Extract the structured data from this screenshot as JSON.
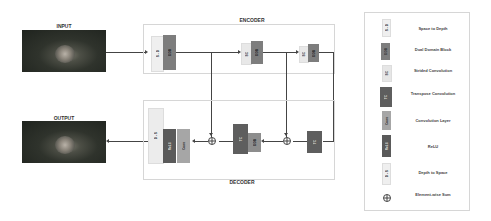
{
  "diagram": {
    "input_label": "INPUT",
    "output_label": "OUTPUT",
    "encoder_label": "ENCODER",
    "decoder_label": "DECODER",
    "encoder_blocks": [
      {
        "id": "s2d",
        "text": "S - D",
        "type": "space-to-depth"
      },
      {
        "id": "ddb1",
        "text": "DDB",
        "type": "dual-domain-block"
      },
      {
        "id": "sc1",
        "text": "SC",
        "type": "strided-convolution"
      },
      {
        "id": "ddb2",
        "text": "DDB",
        "type": "dual-domain-block"
      },
      {
        "id": "sc2",
        "text": "SC",
        "type": "strided-convolution"
      },
      {
        "id": "ddb3",
        "text": "DDB",
        "type": "dual-domain-block"
      }
    ],
    "decoder_blocks": [
      {
        "id": "tc1",
        "text": "TC",
        "type": "transpose-convolution"
      },
      {
        "id": "ddb4",
        "text": "DDB",
        "type": "dual-domain-block"
      },
      {
        "id": "tc2",
        "text": "TC",
        "type": "transpose-convolution"
      },
      {
        "id": "d2s",
        "text": "D - S",
        "type": "depth-to-space"
      },
      {
        "id": "relu",
        "text": "ReLU",
        "type": "relu"
      },
      {
        "id": "conv",
        "text": "Conv",
        "type": "convolution-layer"
      }
    ]
  },
  "legend": {
    "items": [
      {
        "label": "Space to Depth",
        "icon_text": "S - D",
        "icon": "space-to-depth-block-icon"
      },
      {
        "label": "Dual Domain Block",
        "icon_text": "DDB",
        "icon": "dual-domain-block-icon"
      },
      {
        "label": "Strided Convolution",
        "icon_text": "SC",
        "icon": "strided-convolution-block-icon"
      },
      {
        "label": "Transpose Convolution",
        "icon_text": "TC",
        "icon": "transpose-convolution-block-icon"
      },
      {
        "label": "Convolution Layer",
        "icon_text": "Conv",
        "icon": "convolution-layer-block-icon"
      },
      {
        "label": "ReLU",
        "icon_text": "ReLU",
        "icon": "relu-block-icon"
      },
      {
        "label": "Depth to Space",
        "icon_text": "D - S",
        "icon": "depth-to-space-block-icon"
      },
      {
        "label": "Element-wise Sum",
        "icon_text": "",
        "icon": "element-wise-sum-icon"
      }
    ]
  },
  "colors": {
    "light_block": "#ececec",
    "ddb_block": "#7d7d7d",
    "tc_block": "#5e5e5e",
    "conv_block": "#a6a6a6",
    "relu_block": "#5a5a5a",
    "line": "#444444",
    "border": "#d6d6d6"
  }
}
